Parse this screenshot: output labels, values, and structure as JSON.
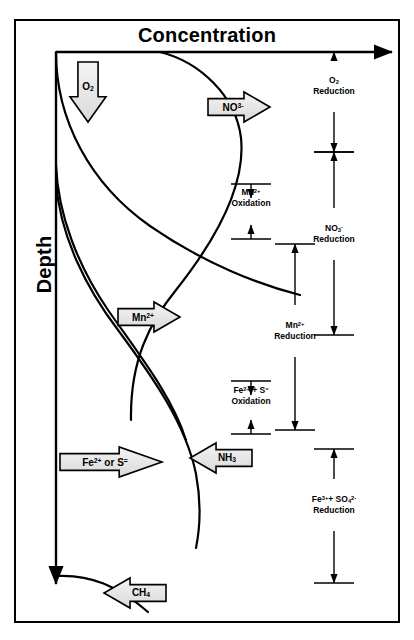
{
  "figure": {
    "title": "Concentration",
    "y_axis_label": "Depth",
    "background": "#ffffff",
    "line_color": "#000000",
    "callout_fill": "#e8e8e8"
  },
  "callouts": [
    {
      "name": "o2",
      "text": "O2",
      "html": "O<sub>2</sub>",
      "direction": "down",
      "x": 70,
      "y": 62,
      "w": 36,
      "h": 60
    },
    {
      "name": "no3",
      "text": "NO3-",
      "html": "NO<sup>3-</sup>",
      "direction": "right",
      "x": 208,
      "y": 92,
      "w": 62,
      "h": 30
    },
    {
      "name": "mn2",
      "text": "Mn2+",
      "html": "Mn<sup>2+</sup>",
      "direction": "right",
      "x": 118,
      "y": 302,
      "w": 62,
      "h": 30
    },
    {
      "name": "fe2-or-s",
      "text": "Fe2+ or S=",
      "html": "Fe<sup>2+</sup> or S<sup>=</sup>",
      "direction": "right",
      "x": 60,
      "y": 447,
      "w": 102,
      "h": 30
    },
    {
      "name": "nh3",
      "text": "NH3",
      "html": "NH<sub>3</sub>",
      "direction": "left",
      "x": 190,
      "y": 443,
      "w": 62,
      "h": 30
    },
    {
      "name": "ch4",
      "text": "CH4",
      "html": "CH<sub>4</sub>",
      "direction": "left",
      "x": 104,
      "y": 578,
      "w": 62,
      "h": 30
    }
  ],
  "zones": [
    {
      "name": "o2-reduction",
      "line1": "O2",
      "line1_html": "O<sub>2</sub>",
      "line2": "Reduction",
      "column": "right",
      "x": 334,
      "y_top": 52,
      "y_bottom": 152,
      "arrow_style": "outward",
      "label_y": 86,
      "cap_top": false,
      "cap_bottom": true
    },
    {
      "name": "mn2-oxidation",
      "line1": "Mn2+",
      "line1_html": "Mn<sup>2+</sup>",
      "line2": "Oxidation",
      "column": "middle",
      "x": 251,
      "y_top": 184,
      "y_bottom": 239,
      "arrow_style": "inward",
      "label_y": 198,
      "cap_top": true,
      "cap_bottom": true
    },
    {
      "name": "no3-reduction",
      "line1": "NO3-",
      "line1_html": "NO<sub>3</sub><sup>-</sup>",
      "line2": "Reduction",
      "column": "right",
      "x": 334,
      "y_top": 152,
      "y_bottom": 335,
      "arrow_style": "outward",
      "label_y": 234,
      "cap_top": true,
      "cap_bottom": true
    },
    {
      "name": "mn2-reduction",
      "line1": "Mn2+",
      "line1_html": "Mn<sup>2+</sup>",
      "line2": "Reduction",
      "column": "inner",
      "x": 295,
      "y_top": 244,
      "y_bottom": 430,
      "arrow_style": "outward",
      "label_y": 331,
      "cap_top": true,
      "cap_bottom": true
    },
    {
      "name": "fe2-s-oxidation",
      "line1": "Fe2+ + S=",
      "line1_html": "Fe<sup>2+</sup> + S<sup>=</sup>",
      "line2": "Oxidation",
      "column": "middle",
      "x": 251,
      "y_top": 381,
      "y_bottom": 434,
      "arrow_style": "inward",
      "label_y": 396,
      "cap_top": true,
      "cap_bottom": true
    },
    {
      "name": "fe3-so4-reduction",
      "line1": "Fe3+ + SO42-",
      "line1_html": "Fe<sup>3+</sup>+ SO<sub>4</sub><sup>2-</sup>",
      "line2": "Reduction",
      "column": "right",
      "x": 334,
      "y_top": 449,
      "y_bottom": 583,
      "arrow_style": "outward",
      "label_y": 505,
      "cap_top": true,
      "cap_bottom": true
    }
  ],
  "curves": [
    {
      "name": "o2-curve",
      "path": "M 56,52 C 56,120 90,184 150,226 C 205,264 260,285 300,295"
    },
    {
      "name": "no3-curve",
      "path": "M 160,52 C 200,62 236,96 241,138 C 246,186 214,242 176,290 C 150,322 130,360 131,420"
    },
    {
      "name": "mn2-curve",
      "path": "M 56,165 C 58,215 78,266 108,310 C 140,356 172,396 186,440"
    },
    {
      "name": "nh3-curve",
      "path": "M 56,182 C 60,236 86,288 118,330 C 152,376 186,424 196,474 C 202,506 200,528 196,548"
    },
    {
      "name": "ch4-curve",
      "path": "M 56,576 C 90,574 118,586 148,612"
    }
  ],
  "axes": {
    "x_axis": {
      "name": "concentration-axis",
      "x1": 56,
      "y1": 52,
      "x2": 392,
      "y2": 52
    },
    "y_axis": {
      "name": "depth-axis",
      "x1": 56,
      "y1": 52,
      "x2": 56,
      "y2": 584
    }
  }
}
